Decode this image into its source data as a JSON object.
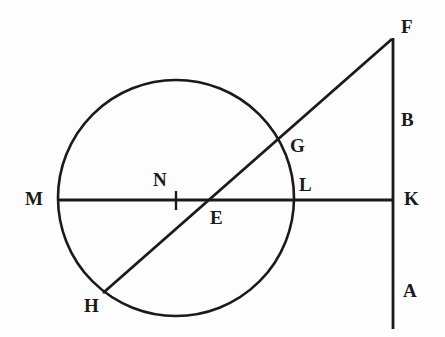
{
  "figure": {
    "kind": "geometry-diagram",
    "background_color": "#fdfdfd",
    "stroke_color": "#1a1a1a",
    "label_color": "#1a1a1a",
    "width": 445,
    "height": 337
  },
  "shapes": {
    "circle": {
      "name": "main-circle",
      "cx": 176,
      "cy": 198,
      "r": 118,
      "stroke_width": 2.6
    },
    "horizontal_line": {
      "name": "line-M-to-K",
      "x1": 57,
      "y1": 200,
      "x2": 394,
      "y2": 200,
      "stroke_width": 2.8
    },
    "vertical_line": {
      "name": "line-F-to-A",
      "x1": 393,
      "y1": 38,
      "x2": 393,
      "y2": 329,
      "stroke_width": 2.8
    },
    "diagonal_line": {
      "name": "line-H-to-F",
      "x1": 103,
      "y1": 293,
      "x2": 392,
      "y2": 39,
      "stroke_width": 2.8
    },
    "center_tick": {
      "name": "center-tick-N",
      "x1": 176,
      "y1": 191,
      "x2": 176,
      "y2": 210,
      "stroke_width": 2.4
    }
  },
  "labels": [
    {
      "id": "F",
      "text": "F",
      "x": 401,
      "y": 17,
      "anchor": "point-F"
    },
    {
      "id": "B",
      "text": "B",
      "x": 401,
      "y": 110,
      "anchor": "segment-B"
    },
    {
      "id": "G",
      "text": "G",
      "x": 290,
      "y": 136,
      "anchor": "point-G"
    },
    {
      "id": "L",
      "text": "L",
      "x": 299,
      "y": 175,
      "anchor": "point-L"
    },
    {
      "id": "N",
      "text": "N",
      "x": 153,
      "y": 170,
      "anchor": "point-N"
    },
    {
      "id": "M",
      "text": "M",
      "x": 25,
      "y": 189,
      "anchor": "point-M"
    },
    {
      "id": "K",
      "text": "K",
      "x": 404,
      "y": 189,
      "anchor": "point-K"
    },
    {
      "id": "E",
      "text": "E",
      "x": 210,
      "y": 208,
      "anchor": "point-E"
    },
    {
      "id": "A",
      "text": "A",
      "x": 403,
      "y": 281,
      "anchor": "segment-A"
    },
    {
      "id": "H",
      "text": "H",
      "x": 84,
      "y": 296,
      "anchor": "point-H"
    }
  ]
}
